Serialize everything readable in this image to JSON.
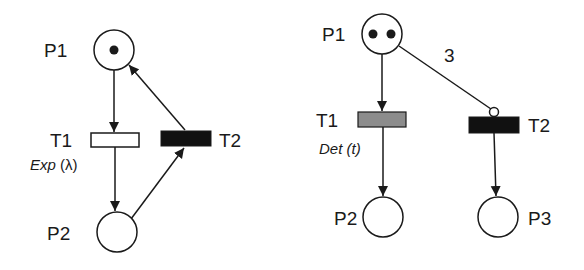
{
  "colors": {
    "stroke": "#1a1a1a",
    "token": "#1a1a1a",
    "place_fill": "#ffffff",
    "timed_exp_fill": "#ffffff",
    "timed_det_fill": "#8c8c8c",
    "immediate_fill": "#111111"
  },
  "left_net": {
    "places": [
      {
        "id": "P1",
        "label": "P1",
        "tokens": 1
      },
      {
        "id": "P2",
        "label": "P2",
        "tokens": 0
      }
    ],
    "transitions": [
      {
        "id": "T1",
        "label": "T1",
        "type": "exponential",
        "annotation_prefix": "Exp",
        "annotation_param": "(λ)"
      },
      {
        "id": "T2",
        "label": "T2",
        "type": "immediate"
      }
    ],
    "arcs": [
      {
        "from": "P1",
        "to": "T1",
        "kind": "normal"
      },
      {
        "from": "T1",
        "to": "P2",
        "kind": "normal"
      },
      {
        "from": "P2",
        "to": "T2",
        "kind": "normal"
      },
      {
        "from": "T2",
        "to": "P1",
        "kind": "normal"
      }
    ]
  },
  "right_net": {
    "places": [
      {
        "id": "P1",
        "label": "P1",
        "tokens": 2
      },
      {
        "id": "P2",
        "label": "P2",
        "tokens": 0
      },
      {
        "id": "P3",
        "label": "P3",
        "tokens": 0
      }
    ],
    "transitions": [
      {
        "id": "T1",
        "label": "T1",
        "type": "deterministic",
        "annotation_prefix": "Det",
        "annotation_param": "(t)"
      },
      {
        "id": "T2",
        "label": "T2",
        "type": "immediate"
      }
    ],
    "arcs": [
      {
        "from": "P1",
        "to": "T1",
        "kind": "normal"
      },
      {
        "from": "T1",
        "to": "P2",
        "kind": "normal"
      },
      {
        "from": "P1",
        "to": "T2",
        "kind": "inhibitor",
        "multiplicity": "3"
      },
      {
        "from": "T2",
        "to": "P3",
        "kind": "normal"
      }
    ]
  }
}
